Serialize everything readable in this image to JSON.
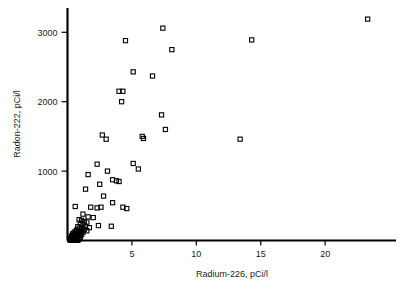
{
  "chart_data": {
    "type": "scatter",
    "title": "",
    "xlabel": "Radium-226, pCi/l",
    "ylabel": "Radon-222, pCi/l",
    "xlim": [
      0,
      25.5
    ],
    "ylim": [
      0,
      3350
    ],
    "xticks": [
      5,
      10,
      15,
      20
    ],
    "yticks": [
      1000,
      2000,
      3000
    ],
    "xtick_labels": [
      "5",
      "10",
      "15",
      "20"
    ],
    "ytick_labels": [
      "1000",
      "2000",
      "3000"
    ],
    "grid": false,
    "legend": null,
    "marker": "open-square",
    "marker_color": "#000000",
    "series": [
      {
        "name": "samples",
        "points": [
          [
            23.3,
            3190
          ],
          [
            7.4,
            3060
          ],
          [
            4.5,
            2880
          ],
          [
            14.3,
            2890
          ],
          [
            8.1,
            2750
          ],
          [
            5.1,
            2430
          ],
          [
            6.6,
            2370
          ],
          [
            4.0,
            2150
          ],
          [
            4.3,
            2150
          ],
          [
            4.2,
            2000
          ],
          [
            7.3,
            1810
          ],
          [
            7.6,
            1600
          ],
          [
            2.7,
            1520
          ],
          [
            5.8,
            1500
          ],
          [
            5.9,
            1470
          ],
          [
            3.0,
            1460
          ],
          [
            13.4,
            1460
          ],
          [
            2.3,
            1100
          ],
          [
            5.1,
            1110
          ],
          [
            3.1,
            1000
          ],
          [
            5.5,
            1030
          ],
          [
            1.6,
            950
          ],
          [
            3.8,
            860
          ],
          [
            4.0,
            850
          ],
          [
            2.5,
            810
          ],
          [
            3.5,
            875
          ],
          [
            1.4,
            740
          ],
          [
            2.8,
            640
          ],
          [
            3.5,
            545
          ],
          [
            0.6,
            490
          ],
          [
            1.8,
            480
          ],
          [
            2.6,
            480
          ],
          [
            2.3,
            470
          ],
          [
            4.3,
            480
          ],
          [
            4.6,
            460
          ],
          [
            1.2,
            380
          ],
          [
            1.6,
            340
          ],
          [
            2.0,
            330
          ],
          [
            0.9,
            300
          ],
          [
            1.1,
            290
          ],
          [
            1.3,
            270
          ],
          [
            1.5,
            265
          ],
          [
            1.0,
            250
          ],
          [
            1.2,
            235
          ],
          [
            2.4,
            215
          ],
          [
            3.4,
            205
          ],
          [
            0.8,
            200
          ],
          [
            1.4,
            195
          ],
          [
            1.7,
            185
          ],
          [
            0.9,
            175
          ],
          [
            1.1,
            170
          ],
          [
            1.3,
            160
          ],
          [
            0.7,
            150
          ],
          [
            1.0,
            145
          ],
          [
            1.5,
            140
          ],
          [
            0.6,
            130
          ],
          [
            0.9,
            125
          ],
          [
            1.2,
            120
          ],
          [
            0.5,
            110
          ],
          [
            0.8,
            105
          ],
          [
            1.0,
            100
          ],
          [
            0.4,
            95
          ],
          [
            0.7,
            90
          ],
          [
            1.1,
            85
          ],
          [
            0.5,
            80
          ],
          [
            0.6,
            75
          ],
          [
            0.9,
            70
          ],
          [
            0.3,
            65
          ],
          [
            0.8,
            60
          ],
          [
            0.4,
            55
          ],
          [
            0.6,
            50
          ],
          [
            1.0,
            48
          ],
          [
            0.3,
            45
          ],
          [
            0.5,
            40
          ],
          [
            0.7,
            35
          ],
          [
            0.2,
            30
          ],
          [
            0.4,
            28
          ],
          [
            0.6,
            25
          ],
          [
            0.9,
            22
          ],
          [
            0.3,
            20
          ],
          [
            0.5,
            18
          ],
          [
            0.2,
            15
          ],
          [
            0.4,
            12
          ],
          [
            0.7,
            10
          ],
          [
            0.3,
            8
          ],
          [
            0.5,
            6
          ],
          [
            0.2,
            5
          ],
          [
            0.6,
            4
          ],
          [
            0.4,
            3
          ],
          [
            0.8,
            2
          ]
        ]
      }
    ]
  }
}
